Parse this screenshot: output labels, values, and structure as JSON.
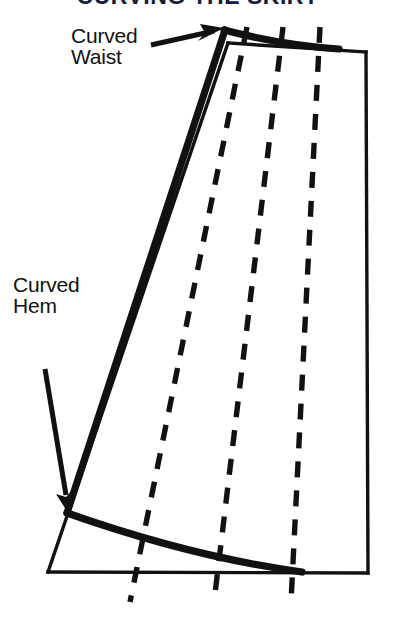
{
  "figure": {
    "kind": "pattern-drafting-diagram",
    "background_color": "#ffffff",
    "ink_color": "#111111",
    "title_color": "#15203a"
  },
  "title": {
    "text": "CURVING THE SKIRT",
    "clipped": true,
    "note": "only the bottom pixel row of the title glyphs is visible at the top edge"
  },
  "labels": [
    {
      "id": "curved-waist",
      "text": "Curved\nWaist",
      "line1": "Curved",
      "line2": "Waist",
      "x": 71,
      "y": 25,
      "arrow": {
        "from_x": 152,
        "from_y": 44,
        "to_x": 222,
        "to_y": 29,
        "points_to": "waist-apex"
      }
    },
    {
      "id": "curved-hem",
      "text": "Curved\nHem",
      "line1": "Curved",
      "line2": "Hem",
      "x": 13,
      "y": 274,
      "arrow": {
        "from_x": 46,
        "from_y": 370,
        "to_x": 70,
        "to_y": 512,
        "points_to": "hem-left-end"
      }
    }
  ],
  "geometry": {
    "outline_quad": {
      "stroke_width": 3,
      "style": "thin-solid",
      "points": [
        {
          "name": "top-left",
          "x": 228,
          "y": 43
        },
        {
          "name": "top-right",
          "x": 366,
          "y": 52
        },
        {
          "name": "bottom-right",
          "x": 368,
          "y": 573
        },
        {
          "name": "bottom-left",
          "x": 48,
          "y": 572
        }
      ]
    },
    "curved_waist_line": {
      "stroke_width": 7,
      "style": "thick-solid",
      "start": {
        "x": 225,
        "y": 30
      },
      "control": {
        "x": 280,
        "y": 44
      },
      "end": {
        "x": 338,
        "y": 48
      }
    },
    "left_side_seam": {
      "stroke_width": 7,
      "style": "thick-solid",
      "start": {
        "x": 225,
        "y": 30
      },
      "end": {
        "x": 67,
        "y": 513
      }
    },
    "curved_hem_line": {
      "stroke_width": 7,
      "style": "thick-solid",
      "start": {
        "x": 67,
        "y": 513
      },
      "control": {
        "x": 190,
        "y": 556
      },
      "end": {
        "x": 300,
        "y": 572
      }
    },
    "dashed_lines": [
      {
        "id": "dashed-1",
        "top": {
          "x": 247,
          "y": 28
        },
        "bottom": {
          "x": 130,
          "y": 600
        },
        "dash_pattern": "16 13"
      },
      {
        "id": "dashed-2",
        "top": {
          "x": 283,
          "y": 28
        },
        "bottom": {
          "x": 214,
          "y": 600
        },
        "dash_pattern": "16 13"
      },
      {
        "id": "dashed-3",
        "top": {
          "x": 320,
          "y": 28
        },
        "bottom": {
          "x": 291,
          "y": 600
        },
        "dash_pattern": "16 13"
      }
    ]
  }
}
